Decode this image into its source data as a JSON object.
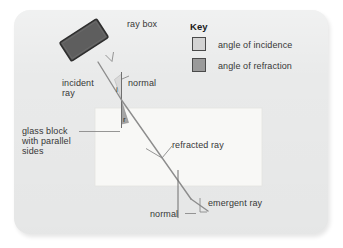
{
  "diagram": {
    "title_absent": true,
    "background_color": "#e9eaea",
    "panel": {
      "x": 14,
      "y": 10,
      "width": 314,
      "height": 224,
      "radius": 16
    },
    "glass_block": {
      "label_lines": [
        "glass block",
        "with parallel",
        "sides"
      ],
      "fill_color": "#f7f7f5",
      "x": 95,
      "y": 108,
      "width": 167,
      "height": 78
    },
    "ray_box": {
      "label": "ray box",
      "fill_color": "#5e5e5e",
      "border_color": "#2b2b2b"
    },
    "labels": {
      "ray_box": "ray box",
      "incident_ray_line1": "incident",
      "incident_ray_line2": "ray",
      "normal_top": "normal",
      "normal_bottom": "normal",
      "refracted_ray": "refracted ray",
      "emergent_ray": "emergent ray",
      "glass_block_line1": "glass block",
      "glass_block_line2": "with parallel",
      "glass_block_line3": "sides",
      "angle_i": "i",
      "angle_r": "r"
    },
    "key": {
      "title": "Key",
      "items": [
        {
          "label": "angle of incidence",
          "color": "#d3d3d3"
        },
        {
          "label": "angle of refraction",
          "color": "#9a9a9a"
        }
      ]
    },
    "colors": {
      "ray_stroke": "#8d8d8d",
      "normal_stroke": "#707070",
      "leader_stroke": "#8a8a8a",
      "text": "#373737"
    }
  }
}
